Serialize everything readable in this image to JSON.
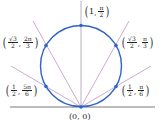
{
  "diagram": {
    "type": "polar-graph",
    "curve": "r = sin(theta) circle",
    "colors": {
      "circle": "#2f63c9",
      "rays": "#b48ab5",
      "axis": "#555555",
      "points": "#2f63c9",
      "text": "#222222"
    },
    "origin_label": "(0, 0)",
    "points": [
      {
        "id": "p-pi-2",
        "r_num": "1",
        "r_den": "",
        "theta_num": "π",
        "theta_den": "2",
        "label": "(1, π/2)"
      },
      {
        "id": "p-pi-3",
        "r_num": "√3",
        "r_den": "2",
        "theta_num": "π",
        "theta_den": "3",
        "label": "(√3/2, π/3)"
      },
      {
        "id": "p-pi-6",
        "r_num": "1",
        "r_den": "2",
        "theta_num": "π",
        "theta_den": "6",
        "label": "(1/2, π/6)"
      },
      {
        "id": "p-2pi-3",
        "r_num": "√3",
        "r_den": "2",
        "theta_num": "2π",
        "theta_den": "3",
        "label": "(√3/2, 2π/3)"
      },
      {
        "id": "p-5pi-6",
        "r_num": "1",
        "r_den": "2",
        "theta_num": "5π",
        "theta_den": "6",
        "label": "(1/2, 5π/6)"
      }
    ]
  }
}
